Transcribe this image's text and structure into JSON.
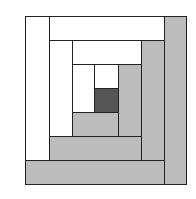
{
  "colors": {
    "light": "#ffffff",
    "medium": "#bcbcbc",
    "dark": "#555555",
    "outline": "#222222"
  },
  "pieces": [
    {
      "name": "outer-left-light-strip",
      "tone": "light",
      "x": 25,
      "y": 16,
      "w": 24,
      "h": 144
    },
    {
      "name": "outer-top-light-strip",
      "tone": "light",
      "x": 49,
      "y": 16,
      "w": 115,
      "h": 24
    },
    {
      "name": "outer-right-gray-strip",
      "tone": "medium",
      "x": 164,
      "y": 16,
      "w": 22,
      "h": 168
    },
    {
      "name": "outer-bottom-gray-strip",
      "tone": "medium",
      "x": 25,
      "y": 160,
      "w": 139,
      "h": 24
    },
    {
      "name": "middle-left-light-strip",
      "tone": "light",
      "x": 49,
      "y": 40,
      "w": 23,
      "h": 96
    },
    {
      "name": "middle-top-light-strip",
      "tone": "light",
      "x": 72,
      "y": 40,
      "w": 69,
      "h": 24
    },
    {
      "name": "middle-right-gray-strip",
      "tone": "medium",
      "x": 141,
      "y": 40,
      "w": 23,
      "h": 120
    },
    {
      "name": "middle-bottom-gray-strip",
      "tone": "medium",
      "x": 49,
      "y": 136,
      "w": 92,
      "h": 24
    },
    {
      "name": "inner-left-light-strip",
      "tone": "light",
      "x": 72,
      "y": 64,
      "w": 22,
      "h": 48
    },
    {
      "name": "inner-top-light-strip",
      "tone": "light",
      "x": 94,
      "y": 64,
      "w": 24,
      "h": 24
    },
    {
      "name": "inner-right-gray-strip",
      "tone": "medium",
      "x": 118,
      "y": 64,
      "w": 23,
      "h": 72
    },
    {
      "name": "inner-bottom-gray-strip",
      "tone": "medium",
      "x": 72,
      "y": 112,
      "w": 46,
      "h": 24
    },
    {
      "name": "center-dark-square",
      "tone": "dark",
      "x": 94,
      "y": 88,
      "w": 24,
      "h": 24
    }
  ]
}
